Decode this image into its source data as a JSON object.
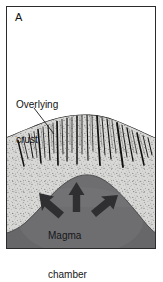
{
  "figure": {
    "panel_letter": "A",
    "type": "geological-cross-section",
    "caption_labels": {
      "crust": "Overlying\ncrust",
      "crust_line1": "Overlying",
      "crust_line2": "crust",
      "magma": "Magma\nchamber",
      "magma_line1": "Magma",
      "magma_line2": "chamber"
    },
    "colors": {
      "frame": "#2b2b2b",
      "background": "#ffffff",
      "crust_fill": "#d8d8d6",
      "crust_stipple": "#4a4a4a",
      "fracture": "#101010",
      "magma_fill": "#6e6e70",
      "magma_shadow": "#5b5b5d",
      "arrow": "#2e2e31",
      "text": "#111111"
    },
    "elements": {
      "crust_label_leader": "line from crust label to stippled crust layer",
      "fracture_count": 22,
      "arrow_count": 3,
      "arrow_directions": [
        "up-left",
        "up",
        "up-right"
      ]
    }
  }
}
